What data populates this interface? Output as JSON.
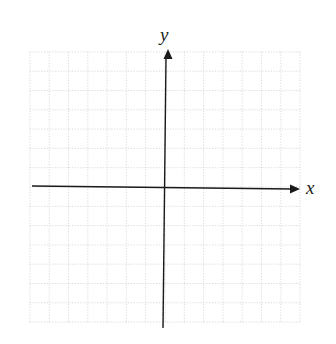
{
  "chart_data": {
    "type": "scatter",
    "title": "",
    "xlabel": "x",
    "ylabel": "y",
    "xlim": [
      -7,
      7
    ],
    "ylim": [
      -7,
      7
    ],
    "grid": true,
    "grid_style": "dotted",
    "x_ticks_labeled": [],
    "y_ticks_labeled": [],
    "series": [],
    "legend": null
  },
  "diagram": {
    "x_axis_label": "x",
    "y_axis_label": "y",
    "grid_cells_per_side": 7,
    "colors": {
      "axis": "#1a1a1a",
      "grid": "#d0d0d0",
      "label": "#222222",
      "background": "#ffffff"
    }
  }
}
